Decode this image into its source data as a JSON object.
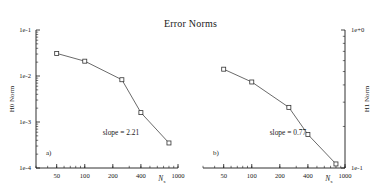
{
  "figure": {
    "title": "Error Norms"
  },
  "chart_data": [
    {
      "type": "line",
      "panel_tag": "a)",
      "title": "Error Norms",
      "xlabel": "N",
      "xlabel_sub": "x",
      "ylabel": "H0 Norm",
      "xscale": "log",
      "yscale": "log",
      "xlim": [
        30,
        1000
      ],
      "ylim": [
        0.0001,
        0.1
      ],
      "xticks": [
        50,
        100,
        200,
        400,
        1000
      ],
      "xticklabels": [
        "50",
        "100",
        "200",
        "400",
        "1000"
      ],
      "yticks": [
        0.1,
        0.01,
        0.001,
        0.0001
      ],
      "yticklabels": [
        "1e-1",
        "1e-2",
        "1e-3",
        "1e-4"
      ],
      "ylabel_side": "left",
      "grid": false,
      "legend": "none",
      "marker": "open-square",
      "annotation": "slope = 2.21",
      "slope": 2.21,
      "x": [
        50,
        100,
        250,
        400,
        800
      ],
      "values": [
        0.031,
        0.021,
        0.0083,
        0.0016,
        0.00035
      ],
      "xtick_minor_count": 18
    },
    {
      "type": "line",
      "panel_tag": "b)",
      "title": "Error Norms",
      "xlabel": "N",
      "xlabel_sub": "x",
      "ylabel": "H1 Norm",
      "xscale": "log",
      "yscale": "log",
      "xlim": [
        30,
        1000
      ],
      "ylim": [
        0.1,
        1.0
      ],
      "xticks": [
        50,
        100,
        200,
        400,
        1000
      ],
      "xticklabels": [
        "50",
        "100",
        "200",
        "400",
        "1000"
      ],
      "yticks": [
        1.0,
        0.1
      ],
      "yticklabels": [
        "1e+0",
        "1e-1"
      ],
      "ylabel_side": "right",
      "grid": false,
      "legend": "none",
      "marker": "open-square",
      "annotation": "slope = 0.77",
      "slope": 0.77,
      "x": [
        50,
        100,
        250,
        400,
        800
      ],
      "values": [
        0.52,
        0.42,
        0.275,
        0.175,
        0.107
      ],
      "xtick_minor_count": 18
    }
  ]
}
